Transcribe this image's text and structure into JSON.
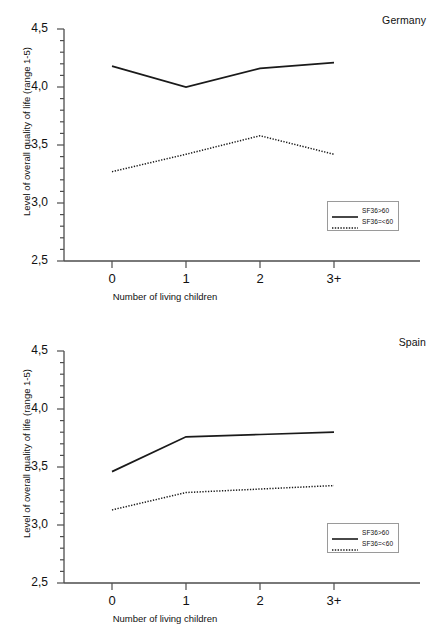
{
  "figure": {
    "background": "#ffffff",
    "line_color": "#1a1a1a",
    "axis_color": "#4d4d4d"
  },
  "chart_data": [
    {
      "type": "line",
      "title": "Germany",
      "xlabel": "Number of living children",
      "ylabel": "Level of overall quality of life (range 1-5)",
      "categories": [
        "0",
        "1",
        "2",
        "3+"
      ],
      "ylim": [
        2.5,
        4.5
      ],
      "yticks": [
        2.5,
        3.0,
        3.5,
        4.0,
        4.5
      ],
      "ytick_labels": [
        "2,5",
        "3,0",
        "3,5",
        "4,0",
        "4,5"
      ],
      "minor_tick_step": 0.1,
      "grid": false,
      "legend_position": "bottom-right",
      "series": [
        {
          "name": "SF36>60",
          "style": "solid",
          "values": [
            4.18,
            4.0,
            4.16,
            4.21
          ]
        },
        {
          "name": "SF36=<60",
          "style": "dotted",
          "values": [
            3.27,
            3.42,
            3.58,
            3.42
          ]
        }
      ]
    },
    {
      "type": "line",
      "title": "Spain",
      "xlabel": "Number of living children",
      "ylabel": "Level of overall quality of life (range 1-5)",
      "categories": [
        "0",
        "1",
        "2",
        "3+"
      ],
      "ylim": [
        2.5,
        4.5
      ],
      "yticks": [
        2.5,
        3.0,
        3.5,
        4.0,
        4.5
      ],
      "ytick_labels": [
        "2,5",
        "3,0",
        "3,5",
        "4,0",
        "4,5"
      ],
      "minor_tick_step": 0.1,
      "grid": false,
      "legend_position": "bottom-right",
      "series": [
        {
          "name": "SF36>60",
          "style": "solid",
          "values": [
            3.46,
            3.76,
            3.78,
            3.8
          ]
        },
        {
          "name": "SF36=<60",
          "style": "dotted",
          "values": [
            3.13,
            3.28,
            3.31,
            3.34
          ]
        }
      ]
    }
  ]
}
